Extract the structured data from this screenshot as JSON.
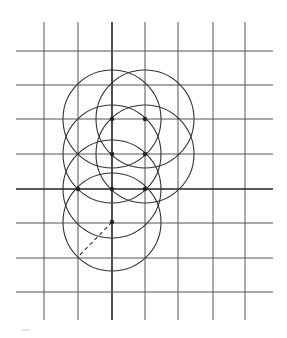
{
  "diagram": {
    "type": "geometric-construction",
    "colors": {
      "background": "#ffffff",
      "grid": "#555555",
      "axis": "#222222",
      "circle": "#333333",
      "point": "#222222"
    },
    "grid": {
      "vertical_x": [
        44,
        78,
        112,
        145,
        178,
        213,
        245
      ],
      "horizontal_y": [
        51,
        85,
        119,
        154,
        189,
        223,
        258,
        292
      ],
      "v_top": 22,
      "v_bottom": 320,
      "h_left": 16,
      "h_right": 273,
      "axis_x": 112,
      "axis_y": 189
    },
    "circle_radius": 49,
    "circles": [
      {
        "cx": 112,
        "cy": 119
      },
      {
        "cx": 145,
        "cy": 119
      },
      {
        "cx": 112,
        "cy": 154
      },
      {
        "cx": 145,
        "cy": 154
      },
      {
        "cx": 112,
        "cy": 189
      },
      {
        "cx": 112,
        "cy": 222
      }
    ],
    "points": [
      {
        "x": 112,
        "y": 119
      },
      {
        "x": 145,
        "y": 119
      },
      {
        "x": 112,
        "y": 154
      },
      {
        "x": 145,
        "y": 154
      },
      {
        "x": 78,
        "y": 189
      },
      {
        "x": 112,
        "y": 189
      },
      {
        "x": 145,
        "y": 189
      },
      {
        "x": 112,
        "y": 222
      }
    ],
    "radius_segment": {
      "x1": 112,
      "y1": 222,
      "x2": 78,
      "y2": 257,
      "style": "dashed"
    }
  }
}
